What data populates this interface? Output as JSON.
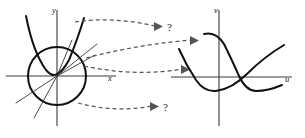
{
  "figure": {
    "background_color": "#ffffff",
    "ink_color": "#111111",
    "axis_color": "#3a3a3a",
    "dash_color": "#555555"
  },
  "source_plane": {
    "name": "xy-plane",
    "x_axis_label": "x",
    "y_axis_label": "y",
    "origin": {
      "x": 57,
      "y": 76
    },
    "objects": [
      {
        "name": "circle",
        "kind": "circle",
        "center_x": 57,
        "center_y": 76,
        "radius": 29
      },
      {
        "name": "parabola",
        "kind": "parabola",
        "opens": "up",
        "vertex_x": 57,
        "vertex_y": 72
      },
      {
        "name": "ray-upper-right",
        "kind": "line",
        "through_origin": true
      },
      {
        "name": "ray-lower-left",
        "kind": "line",
        "through_origin": true
      },
      {
        "name": "ray-lower-right",
        "kind": "line",
        "through_origin": true
      },
      {
        "name": "ray-steep-down",
        "kind": "line",
        "through_origin": true
      }
    ]
  },
  "target_plane": {
    "name": "uv-plane",
    "x_axis_label": "u",
    "y_axis_label": "v",
    "origin": {
      "x": 219,
      "y": 77
    },
    "objects": [
      {
        "name": "image-curve-upper",
        "kind": "sigmoid-descending"
      },
      {
        "name": "image-curve-lower",
        "kind": "sigmoid-ascending"
      }
    ]
  },
  "mappings": [
    {
      "name": "arrow-top",
      "label": "?",
      "resolved": false
    },
    {
      "name": "arrow-middle-upper",
      "label": "",
      "resolved": true
    },
    {
      "name": "arrow-middle-lower",
      "label": "",
      "resolved": true
    },
    {
      "name": "arrow-bottom",
      "label": "?",
      "resolved": false
    }
  ],
  "annotations": {
    "question_mark": "?"
  }
}
